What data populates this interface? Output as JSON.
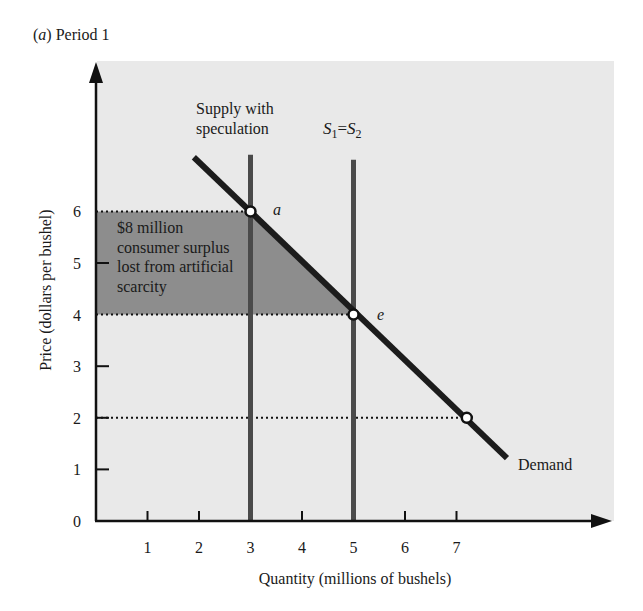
{
  "panel": {
    "label_letter": "a",
    "label_text": "Period 1"
  },
  "colors": {
    "background": "#ffffff",
    "plot_panel": "#e9e9e9",
    "shaded_area": "#8d8d8d",
    "supply_line": "#4a4a4a",
    "demand_line": "#1c1c1c",
    "axis": "#111111"
  },
  "chart_data": {
    "type": "line",
    "title": "(a) Period 1",
    "xlabel": "Quantity (millions of bushels)",
    "ylabel": "Price (dollars per bushel)",
    "xlim": [
      0,
      8.8
    ],
    "ylim": [
      0,
      8.8
    ],
    "x_ticks": [
      1,
      2,
      3,
      4,
      5,
      6,
      7
    ],
    "y_ticks": [
      0,
      1,
      2,
      3,
      4,
      5,
      6
    ],
    "grid": false,
    "series": [
      {
        "name": "Demand",
        "kind": "line",
        "points": [
          [
            1.0,
            7.0
          ],
          [
            7.0,
            1.2
          ]
        ],
        "label": "Demand"
      },
      {
        "name": "Supply with speculation",
        "kind": "vertical",
        "x": 3,
        "y_range": [
          0,
          7.1
        ],
        "label": "Supply with speculation"
      },
      {
        "name": "S1 = S2",
        "kind": "vertical",
        "x": 5,
        "y_range": [
          0,
          7.0
        ],
        "label": "S₁ = S₂"
      }
    ],
    "points": [
      {
        "name": "a",
        "x": 3,
        "y": 6
      },
      {
        "name": "e",
        "x": 5,
        "y": 4
      },
      {
        "name": "",
        "x": 7.2,
        "y": 2
      }
    ],
    "reference_lines": [
      {
        "y": 6,
        "from_x": 0,
        "to_x": 3,
        "style": "dotted"
      },
      {
        "y": 4,
        "from_x": 0,
        "to_x": 5,
        "style": "dotted"
      },
      {
        "y": 2,
        "from_x": 0,
        "to_x": 7.2,
        "style": "dotted"
      }
    ],
    "shaded_region": {
      "polygon": [
        [
          0,
          6
        ],
        [
          3,
          6
        ],
        [
          5,
          4
        ],
        [
          0,
          4
        ]
      ],
      "label_lines": [
        "$8 million",
        "consumer surplus",
        "lost from artificial",
        "scarcity"
      ],
      "value": "$8 million consumer surplus lost from artificial scarcity"
    },
    "annotations": {
      "supply_speculation_lines": [
        "Supply with",
        "speculation"
      ],
      "s1_s2": {
        "S": "S",
        "sub1": "1",
        "eq": "=",
        "sub2": "2"
      },
      "point_a": "a",
      "point_e": "e",
      "demand": "Demand"
    }
  }
}
